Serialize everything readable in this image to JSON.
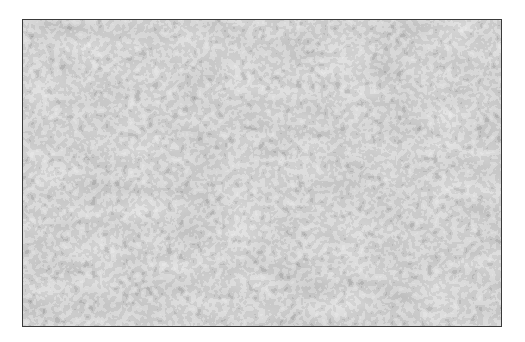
{
  "image": {
    "description": "Grayscale histology micrograph showing densely packed round cells with dark nuclei and clear cytoplasm, separated by thin fibrous septa",
    "palette": {
      "background": "#8e8e8e",
      "nucleus": "#3a3a3a",
      "cytoplasm": "#c8c8c8",
      "stroma": "#a8a8a8"
    }
  }
}
